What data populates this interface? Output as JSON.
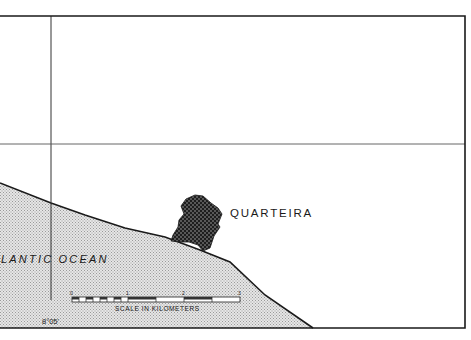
{
  "map": {
    "place_label": "QUARTEIRA",
    "water_label": "LANTIC OCEAN",
    "longitude_label": "8°05'",
    "scale": {
      "title": "SCALE IN KILOMETERS",
      "ticks": [
        "0",
        "1",
        "2",
        "3"
      ]
    },
    "colors": {
      "land": "#ffffff",
      "ocean_stipple": "#c8c8c8",
      "town_fill": "#2a2a2a",
      "lines": "#222222"
    }
  }
}
